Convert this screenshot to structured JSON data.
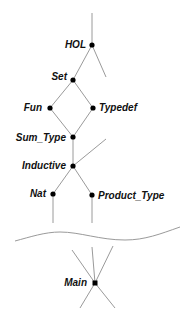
{
  "diagram": {
    "nodes": [
      {
        "id": "HOL",
        "label": "HOL",
        "x": 92,
        "y": 45,
        "label_side": "left"
      },
      {
        "id": "Set",
        "label": "Set",
        "x": 73,
        "y": 80,
        "label_side": "left"
      },
      {
        "id": "Fun",
        "label": "Fun",
        "x": 50,
        "y": 108,
        "label_side": "left"
      },
      {
        "id": "Typedef",
        "label": "Typedef",
        "x": 93,
        "y": 108,
        "label_side": "right"
      },
      {
        "id": "Sum_Type",
        "label": "Sum_Type",
        "x": 73,
        "y": 137,
        "label_side": "left"
      },
      {
        "id": "Inductive",
        "label": "Inductive",
        "x": 73,
        "y": 166,
        "label_side": "left"
      },
      {
        "id": "Nat",
        "label": "Nat",
        "x": 53,
        "y": 194,
        "label_side": "left"
      },
      {
        "id": "Product_Type",
        "label": "Product_Type",
        "x": 92,
        "y": 195,
        "label_side": "right"
      },
      {
        "id": "Main",
        "label": "Main",
        "x": 95,
        "y": 283,
        "label_side": "left"
      }
    ],
    "edges": [
      [
        "HOL",
        "Set"
      ],
      [
        "Set",
        "Fun"
      ],
      [
        "Set",
        "Typedef"
      ],
      [
        "Fun",
        "Sum_Type"
      ],
      [
        "Typedef",
        "Sum_Type"
      ],
      [
        "Sum_Type",
        "Inductive"
      ],
      [
        "Inductive",
        "Nat"
      ],
      [
        "Inductive",
        "Product_Type"
      ]
    ],
    "break_symbol": "wavy-line",
    "colors": {
      "edge": "#9a9a9a",
      "node": "#000000",
      "label": "#111111",
      "background": "#ffffff"
    }
  }
}
